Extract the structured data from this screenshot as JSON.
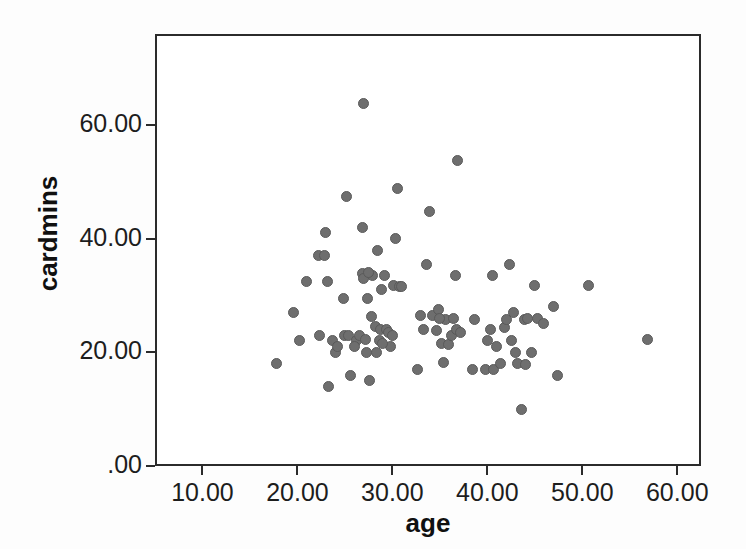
{
  "chart_data": {
    "type": "scatter",
    "title": "",
    "xlabel": "age",
    "ylabel": "cardmins",
    "xlim": [
      5.0,
      62.5
    ],
    "ylim": [
      0.0,
      76.0
    ],
    "grid": false,
    "legend": null,
    "marker": {
      "shape": "circle",
      "fill_color": "#6e6e6e",
      "edge_color": "#5a5a5a",
      "size_px": 11
    },
    "xticks": [
      10,
      20,
      30,
      40,
      50,
      60
    ],
    "xtick_labels": [
      "10.00",
      "20.00",
      "30.00",
      "40.00",
      "50.00",
      "60.00"
    ],
    "yticks": [
      0,
      20,
      40,
      60
    ],
    "ytick_labels": [
      ".00",
      "20.00",
      "40.00",
      "60.00"
    ],
    "n_points": 97,
    "points": [
      [
        17.8,
        18.0
      ],
      [
        19.6,
        27.0
      ],
      [
        20.2,
        22.0
      ],
      [
        21.0,
        32.5
      ],
      [
        22.2,
        37.0
      ],
      [
        22.3,
        23.0
      ],
      [
        22.8,
        37.0
      ],
      [
        23.0,
        41.0
      ],
      [
        23.2,
        32.5
      ],
      [
        23.3,
        14.0
      ],
      [
        23.7,
        22.0
      ],
      [
        24.0,
        20.0
      ],
      [
        24.2,
        21.0
      ],
      [
        24.8,
        29.5
      ],
      [
        25.0,
        23.0
      ],
      [
        25.2,
        47.5
      ],
      [
        25.4,
        23.0
      ],
      [
        25.6,
        16.0
      ],
      [
        26.2,
        22.0
      ],
      [
        26.5,
        23.0
      ],
      [
        26.8,
        33.8
      ],
      [
        26.9,
        42.0
      ],
      [
        27.0,
        33.0
      ],
      [
        27.0,
        63.8
      ],
      [
        27.2,
        22.2
      ],
      [
        27.3,
        20.0
      ],
      [
        27.4,
        29.5
      ],
      [
        27.6,
        15.0
      ],
      [
        27.8,
        26.3
      ],
      [
        27.9,
        33.5
      ],
      [
        28.2,
        24.5
      ],
      [
        28.4,
        38.0
      ],
      [
        28.6,
        22.0
      ],
      [
        28.7,
        24.0
      ],
      [
        28.9,
        31.0
      ],
      [
        29.2,
        33.5
      ],
      [
        29.4,
        24.0
      ],
      [
        29.6,
        23.5
      ],
      [
        29.8,
        21.0
      ],
      [
        30.1,
        31.8
      ],
      [
        30.3,
        40.0
      ],
      [
        30.5,
        48.8
      ],
      [
        30.8,
        31.5
      ],
      [
        32.6,
        17.0
      ],
      [
        33.0,
        26.5
      ],
      [
        33.3,
        24.0
      ],
      [
        33.6,
        35.5
      ],
      [
        33.9,
        44.8
      ],
      [
        34.2,
        26.5
      ],
      [
        34.6,
        23.8
      ],
      [
        34.9,
        27.5
      ],
      [
        35.2,
        21.5
      ],
      [
        35.4,
        18.2
      ],
      [
        35.6,
        25.8
      ],
      [
        35.9,
        21.3
      ],
      [
        36.2,
        23.0
      ],
      [
        36.4,
        26.0
      ],
      [
        36.6,
        33.5
      ],
      [
        36.8,
        24.0
      ],
      [
        36.9,
        53.8
      ],
      [
        37.2,
        23.5
      ],
      [
        38.4,
        17.0
      ],
      [
        38.6,
        25.8
      ],
      [
        39.8,
        17.0
      ],
      [
        40.0,
        22.0
      ],
      [
        40.3,
        24.0
      ],
      [
        40.5,
        33.5
      ],
      [
        40.6,
        17.0
      ],
      [
        41.0,
        21.0
      ],
      [
        41.4,
        18.0
      ],
      [
        41.8,
        24.3
      ],
      [
        42.0,
        25.8
      ],
      [
        42.3,
        35.5
      ],
      [
        42.5,
        22.0
      ],
      [
        42.8,
        27.0
      ],
      [
        43.0,
        20.0
      ],
      [
        43.2,
        18.0
      ],
      [
        43.6,
        10.0
      ],
      [
        43.9,
        25.8
      ],
      [
        44.2,
        26.0
      ],
      [
        44.6,
        20.0
      ],
      [
        45.0,
        31.8
      ],
      [
        45.3,
        26.0
      ],
      [
        45.9,
        25.0
      ],
      [
        47.0,
        28.0
      ],
      [
        47.4,
        16.0
      ],
      [
        50.7,
        31.8
      ],
      [
        56.9,
        22.3
      ],
      [
        29.0,
        21.5
      ],
      [
        27.5,
        34.0
      ],
      [
        28.3,
        20.0
      ],
      [
        26.0,
        21.0
      ],
      [
        30.0,
        23.0
      ],
      [
        31.0,
        31.5
      ],
      [
        35.0,
        26.0
      ],
      [
        44.0,
        17.8
      ]
    ]
  }
}
